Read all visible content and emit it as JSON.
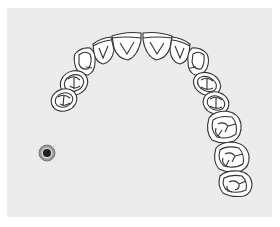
{
  "diagram": {
    "type": "dental-arch-occlusal-view",
    "arch": "maxillary",
    "background_color": "#ececec",
    "outline_color": "#333333",
    "teeth": [
      {
        "id": "left-central-incisor",
        "type": "incisor",
        "side": "left"
      },
      {
        "id": "left-lateral-incisor",
        "type": "incisor",
        "side": "left"
      },
      {
        "id": "left-canine",
        "type": "canine",
        "side": "left"
      },
      {
        "id": "left-first-premolar",
        "type": "premolar",
        "side": "left"
      },
      {
        "id": "left-second-premolar",
        "type": "premolar",
        "side": "left"
      },
      {
        "id": "right-central-incisor",
        "type": "incisor",
        "side": "right"
      },
      {
        "id": "right-lateral-incisor",
        "type": "incisor",
        "side": "right"
      },
      {
        "id": "right-canine",
        "type": "canine",
        "side": "right"
      },
      {
        "id": "right-first-premolar",
        "type": "premolar",
        "side": "right"
      },
      {
        "id": "right-second-premolar",
        "type": "premolar",
        "side": "right"
      },
      {
        "id": "right-first-molar",
        "type": "molar",
        "side": "right"
      },
      {
        "id": "right-second-molar",
        "type": "molar",
        "side": "right"
      },
      {
        "id": "right-third-molar",
        "type": "molar",
        "side": "right"
      }
    ],
    "marker": {
      "name": "selection-marker",
      "color": "#222222",
      "ring_color": "#888888"
    }
  }
}
